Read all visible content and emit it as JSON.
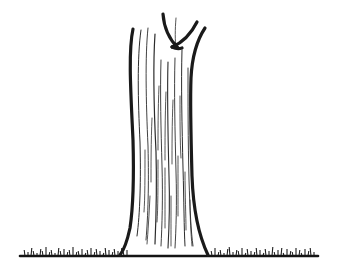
{
  "image": {
    "title": "Tree trunk line drawing",
    "subject": "tree-trunk",
    "style": "black ink line art on white background",
    "width": 339,
    "height": 278,
    "alt_text": "A simple black-and-white ink drawing of a tall tree trunk with a V-shaped fork at the top, vertical bark striations, a flared base, and small tufts of grass along a horizontal ground line."
  },
  "colors": {
    "background": "#ffffff",
    "outline": "#1a1a1a",
    "bark_line": "#2b2b2b",
    "ground": "#141414",
    "grass": "#1f1f1f"
  },
  "scene": {
    "ground": {
      "label": "ground line",
      "y": 256,
      "x_start": 20,
      "x_end": 318,
      "stroke_width": 2.6
    },
    "grass": {
      "label": "grass tufts",
      "blade_height_min": 3,
      "blade_height_max": 9,
      "stroke_width": 1.1,
      "left_patch": {
        "x_start": 24,
        "x_end": 128
      },
      "right_patch": {
        "x_start": 210,
        "x_end": 316
      },
      "left_blades": [
        [
          25,
          6
        ],
        [
          28,
          4
        ],
        [
          31,
          8
        ],
        [
          34,
          5
        ],
        [
          37,
          3
        ],
        [
          40,
          7
        ],
        [
          43,
          5
        ],
        [
          46,
          9
        ],
        [
          49,
          4
        ],
        [
          52,
          6
        ],
        [
          55,
          3
        ],
        [
          58,
          8
        ],
        [
          61,
          5
        ],
        [
          64,
          7
        ],
        [
          67,
          4
        ],
        [
          70,
          6
        ],
        [
          73,
          9
        ],
        [
          76,
          4
        ],
        [
          79,
          5
        ],
        [
          82,
          7
        ],
        [
          85,
          3
        ],
        [
          88,
          6
        ],
        [
          91,
          8
        ],
        [
          94,
          4
        ],
        [
          97,
          7
        ],
        [
          100,
          5
        ],
        [
          103,
          3
        ],
        [
          106,
          8
        ],
        [
          109,
          6
        ],
        [
          112,
          4
        ],
        [
          115,
          7
        ],
        [
          118,
          5
        ],
        [
          121,
          8
        ],
        [
          124,
          4
        ],
        [
          127,
          6
        ]
      ],
      "right_blades": [
        [
          212,
          5
        ],
        [
          215,
          8
        ],
        [
          218,
          4
        ],
        [
          221,
          6
        ],
        [
          224,
          3
        ],
        [
          227,
          7
        ],
        [
          230,
          9
        ],
        [
          233,
          4
        ],
        [
          236,
          6
        ],
        [
          239,
          5
        ],
        [
          242,
          8
        ],
        [
          245,
          3
        ],
        [
          248,
          7
        ],
        [
          251,
          5
        ],
        [
          254,
          4
        ],
        [
          257,
          8
        ],
        [
          260,
          6
        ],
        [
          263,
          3
        ],
        [
          266,
          7
        ],
        [
          269,
          5
        ],
        [
          272,
          9
        ],
        [
          275,
          4
        ],
        [
          278,
          6
        ],
        [
          281,
          8
        ],
        [
          284,
          3
        ],
        [
          287,
          7
        ],
        [
          290,
          5
        ],
        [
          293,
          4
        ],
        [
          296,
          8
        ],
        [
          299,
          6
        ],
        [
          302,
          3
        ],
        [
          305,
          7
        ],
        [
          308,
          5
        ],
        [
          311,
          8
        ],
        [
          314,
          4
        ]
      ]
    },
    "trunk": {
      "label": "tree trunk",
      "top_y": 14,
      "base_y": 256,
      "base_left_x": 128,
      "base_right_x": 208,
      "mid_left_x": 136,
      "mid_right_x": 194,
      "stroke_width": 3.2,
      "left_edge_path": "M133,29 C128,52 131,96 133,140 C134,176 133,208 130,228 C127,242 124,250 120,255",
      "right_edge_path": "M205,28 C197,40 192,58 191,78 C190,104 191,140 192,176 C193,204 197,232 208,255",
      "fork_left_path": "M163,14 C164,28 170,40 178,48",
      "fork_right_path": "M197,22 C192,32 184,42 172,47",
      "fork_tip_path": "M172,47 C176,49 179,49 182,48"
    },
    "bark_lines": {
      "label": "bark striations",
      "stroke_width_min": 0.8,
      "stroke_width_max": 1.4,
      "count": 22,
      "paths": [
        {
          "d": "M141,30 C137,58 138,100 140,142 C141,180 140,214 137,236",
          "w": 1.0
        },
        {
          "d": "M148,28 C145,56 146,102 148,146 C149,186 148,216 146,240",
          "w": 0.9
        },
        {
          "d": "M155,34 C153,64 154,110 156,152 C157,188 156,220 155,244",
          "w": 1.2
        },
        {
          "d": "M161,60 C160,92 161,130 162,166 C163,198 162,226 161,246",
          "w": 0.9
        },
        {
          "d": "M168,62 C167,96 168,138 169,176 C170,206 169,230 168,248",
          "w": 1.1
        },
        {
          "d": "M175,58 C174,90 175,132 176,172 C177,204 176,230 175,248",
          "w": 0.9
        },
        {
          "d": "M182,50 C181,84 182,126 183,168 C184,202 184,228 185,246",
          "w": 1.0
        },
        {
          "d": "M188,68 C188,100 188,140 189,180 C190,210 191,232 193,246",
          "w": 0.9
        },
        {
          "d": "M159,86 C158,110 158,132 158,150",
          "w": 0.8
        },
        {
          "d": "M166,92 C165,118 165,142 165,160",
          "w": 0.8
        },
        {
          "d": "M173,100 C172,124 172,148 172,164",
          "w": 0.8
        },
        {
          "d": "M180,96 C180,120 180,142 181,158",
          "w": 0.8
        },
        {
          "d": "M152,118 C151,142 151,166 151,182",
          "w": 0.8
        },
        {
          "d": "M145,150 C145,176 145,198 144,212",
          "w": 0.8
        },
        {
          "d": "M158,160 C158,186 158,208 157,222",
          "w": 0.8
        },
        {
          "d": "M165,168 C165,192 165,214 165,228",
          "w": 0.8
        },
        {
          "d": "M178,156 C178,180 178,202 178,216",
          "w": 0.8
        },
        {
          "d": "M185,172 C185,196 186,216 186,230",
          "w": 0.8
        },
        {
          "d": "M150,196 C149,216 148,232 147,244",
          "w": 0.8
        },
        {
          "d": "M171,196 C171,216 171,232 171,246",
          "w": 0.8
        },
        {
          "d": "M190,200 C190,218 191,234 192,246",
          "w": 0.8
        },
        {
          "d": "M176,18 C175,30 175,40 176,48",
          "w": 0.8
        }
      ]
    }
  }
}
